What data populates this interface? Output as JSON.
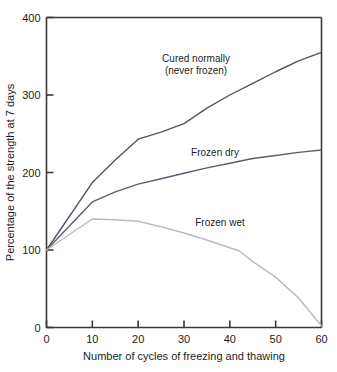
{
  "chart_data": {
    "type": "line",
    "title": "",
    "xlabel": "Number of cycles of freezing and thawing",
    "ylabel": "Percentage of the strength at 7 days",
    "xlim": [
      0,
      60
    ],
    "ylim": [
      0,
      400
    ],
    "xticks": [
      0,
      10,
      20,
      30,
      40,
      50,
      60
    ],
    "yticks": [
      0,
      100,
      200,
      300,
      400
    ],
    "xtick_labels": [
      "0",
      "10",
      "20",
      "30",
      "40",
      "50",
      "60"
    ],
    "ytick_labels": [
      "0",
      "100",
      "200",
      "300",
      "400"
    ],
    "grid": false,
    "legend_position": "inline-annotations",
    "series": [
      {
        "name": "Cured normally (never frozen)",
        "label_lines": [
          "Cured normally",
          "(never frozen)"
        ],
        "color": "#4e5563",
        "x": [
          0,
          10,
          15,
          20,
          25,
          30,
          35,
          40,
          45,
          50,
          55,
          60
        ],
        "values": [
          100,
          187,
          216,
          243,
          252,
          263,
          283,
          300,
          315,
          330,
          344,
          355
        ]
      },
      {
        "name": "Frozen dry",
        "label_lines": [
          "Frozen dry"
        ],
        "color": "#5a6070",
        "x": [
          0,
          10,
          15,
          20,
          25,
          30,
          35,
          40,
          45,
          50,
          55,
          60
        ],
        "values": [
          100,
          162,
          175,
          185,
          192,
          199,
          206,
          212,
          218,
          222,
          226,
          229
        ]
      },
      {
        "name": "Frozen wet",
        "label_lines": [
          "Frozen wet"
        ],
        "color": "#b9bcc0",
        "x": [
          0,
          10,
          15,
          20,
          25,
          30,
          35,
          40,
          42,
          45,
          50,
          55,
          60
        ],
        "values": [
          100,
          140,
          139,
          137,
          130,
          122,
          113,
          103,
          99,
          85,
          65,
          38,
          2
        ]
      }
    ],
    "annotations": [
      {
        "text_lines": [
          "Cured normally",
          "(never frozen)"
        ],
        "x_px": 196,
        "y_px": 62
      },
      {
        "text_lines": [
          "Frozen dry"
        ],
        "x_px": 215,
        "y_px": 156
      },
      {
        "text_lines": [
          "Frozen wet"
        ],
        "x_px": 220,
        "y_px": 226
      }
    ]
  }
}
